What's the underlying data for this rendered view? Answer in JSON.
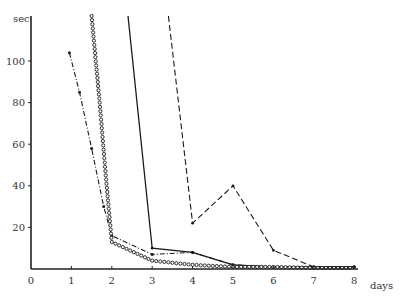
{
  "chart_data": {
    "type": "line",
    "title": "",
    "xlabel": "days",
    "ylabel": "sec",
    "xlim": [
      0,
      8.3
    ],
    "ylim": [
      0,
      125
    ],
    "grid": false,
    "legend": null,
    "x_ticks": [
      "0",
      "1",
      "2",
      "3",
      "4",
      "5",
      "6",
      "7",
      "8"
    ],
    "y_ticks": [
      "20",
      "40",
      "60",
      "80",
      "100"
    ],
    "series": [
      {
        "name": "solid",
        "style": "solid",
        "points": [
          [
            2.4,
            122
          ],
          [
            3,
            10
          ],
          [
            4,
            8
          ],
          [
            5,
            2
          ],
          [
            6,
            1
          ],
          [
            7,
            1
          ],
          [
            8,
            1
          ]
        ]
      },
      {
        "name": "dashed",
        "style": "dashed",
        "points": [
          [
            3.4,
            122
          ],
          [
            4,
            22
          ],
          [
            5,
            40
          ],
          [
            6,
            9
          ],
          [
            7,
            1
          ],
          [
            8,
            1
          ]
        ]
      },
      {
        "name": "dash-dot-markers",
        "style": "dash-dot",
        "points": [
          [
            0.95,
            104
          ],
          [
            1.2,
            85
          ],
          [
            1.5,
            58
          ],
          [
            1.8,
            30
          ],
          [
            2,
            16
          ],
          [
            3,
            7
          ],
          [
            4,
            8
          ],
          [
            5,
            2
          ],
          [
            6,
            1
          ],
          [
            7,
            1
          ],
          [
            8,
            1
          ]
        ]
      },
      {
        "name": "dotted-circles",
        "style": "dotted",
        "points": [
          [
            1.5,
            122
          ],
          [
            1.7,
            80
          ],
          [
            1.85,
            45
          ],
          [
            2,
            13
          ],
          [
            3,
            4
          ],
          [
            4,
            2
          ],
          [
            5,
            1
          ],
          [
            6,
            1
          ],
          [
            7,
            0.5
          ],
          [
            8,
            0.5
          ]
        ]
      }
    ]
  },
  "axis": {
    "y_unit": "sec",
    "x_unit": "days",
    "x_tick_labels": [
      "0",
      "1",
      "2",
      "3",
      "4",
      "5",
      "6",
      "7",
      "8"
    ],
    "y_tick_labels": [
      "20",
      "40",
      "60",
      "80",
      "100"
    ]
  }
}
